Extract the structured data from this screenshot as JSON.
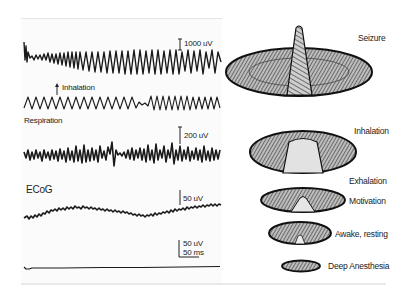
{
  "figure": {
    "traces": [
      {
        "id": "seizure",
        "scale_label": "1000 uV"
      },
      {
        "id": "respiration",
        "label": "Respiration",
        "marker_label": "Inhalation"
      },
      {
        "id": "olfactory-bulb",
        "scale_label": "200 uV"
      },
      {
        "id": "ecog",
        "label": "ECoG",
        "scale_label": "50 uV"
      },
      {
        "id": "flat",
        "scale_label_v": "50 uV",
        "scale_label_t": "50 ms"
      }
    ],
    "states": [
      {
        "label": "Seizure"
      },
      {
        "label": "Inhalation"
      },
      {
        "label": "Exhalation"
      },
      {
        "label": "Motivation"
      },
      {
        "label": "Awake, resting"
      },
      {
        "label": "Deep Anesthesia"
      }
    ]
  }
}
